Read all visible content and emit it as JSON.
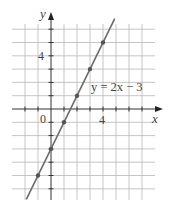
{
  "chart_data": {
    "type": "line",
    "title": "",
    "equation_label": "y = 2x − 3",
    "xlabel": "x",
    "ylabel": "y",
    "origin_label": "0",
    "x_tick_labels": [
      {
        "value": 4,
        "label": "4"
      }
    ],
    "y_tick_labels": [
      {
        "value": 4,
        "label": "4"
      }
    ],
    "xlim": [
      -3,
      7
    ],
    "ylim": [
      -6,
      7
    ],
    "grid": true,
    "grid_step": 1,
    "series": [
      {
        "name": "y = 2x − 3",
        "slope": 2,
        "intercept": -3,
        "line_range_x": [
          -1.9,
          4.9
        ],
        "points": [
          {
            "x": -1,
            "y": -5
          },
          {
            "x": 0,
            "y": -3
          },
          {
            "x": 1,
            "y": -1
          },
          {
            "x": 2,
            "y": 1
          },
          {
            "x": 3,
            "y": 3
          },
          {
            "x": 4,
            "y": 5
          }
        ]
      }
    ]
  },
  "colors": {
    "grid": "#b8b8b8",
    "axis": "#333333",
    "line": "#6b6b6b",
    "points": "#555555",
    "text": "#444444"
  }
}
